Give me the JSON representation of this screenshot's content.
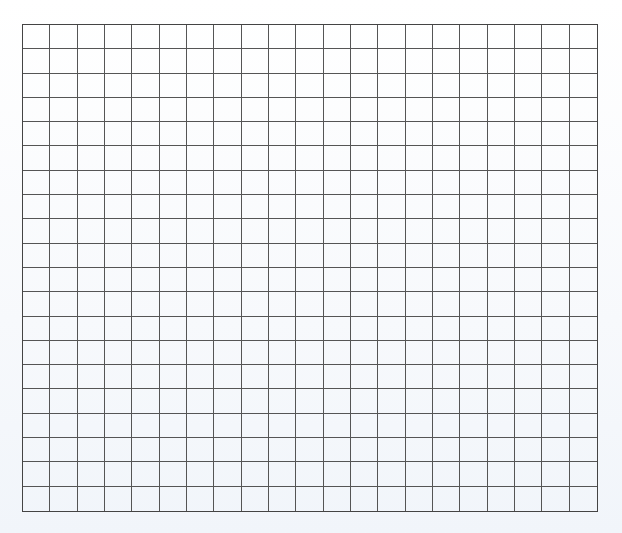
{
  "grid": {
    "rows": 20,
    "columns": 21,
    "line_color": "#555555",
    "border_color": "#444444",
    "background_color": "#ffffff"
  }
}
